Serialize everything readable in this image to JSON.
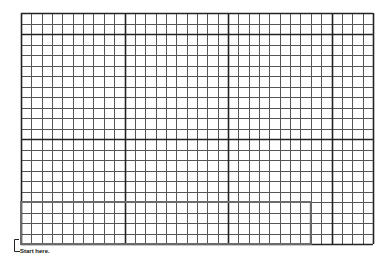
{
  "grid": {
    "columns": 34,
    "rows": 22,
    "major_col_every": 10,
    "major_row_lines": [
      2,
      12
    ],
    "left": 21,
    "top": 13,
    "cell_width": 10.35,
    "cell_height": 10.5,
    "line_color": "#222222",
    "minor_line_color": "#555555"
  },
  "highlight_box": {
    "col_start": 0,
    "col_end": 28,
    "row_start": 18,
    "row_end": 22,
    "color": "#6b6b6b"
  },
  "start_marker": {
    "label": "Start here."
  }
}
